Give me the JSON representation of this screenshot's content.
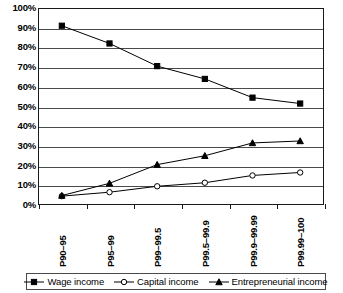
{
  "chart_data": {
    "type": "line",
    "title": "",
    "xlabel": "",
    "ylabel": "",
    "ylim": [
      0,
      100
    ],
    "ytick_labels": [
      "100%",
      "90%",
      "80%",
      "70%",
      "60%",
      "50%",
      "40%",
      "30%",
      "20%",
      "10%",
      "0%"
    ],
    "ytick_values": [
      100,
      90,
      80,
      70,
      60,
      50,
      40,
      30,
      20,
      10,
      0
    ],
    "grid": "horizontal",
    "legend_position": "bottom",
    "categories": [
      "P90–95",
      "P95–99",
      "P99–99.5",
      "P99.5–99.9",
      "P99.9–99.99",
      "P99.99–100"
    ],
    "series": [
      {
        "name": "Wage income",
        "marker": "filled-square",
        "color": "#000000",
        "values": [
          91,
          82,
          70.5,
          64,
          54.5,
          51.5
        ]
      },
      {
        "name": "Capital income",
        "marker": "open-circle",
        "color": "#000000",
        "values": [
          4.5,
          6.5,
          9.5,
          11.3,
          15,
          16.5
        ]
      },
      {
        "name": "Entrepreneurial income",
        "marker": "filled-triangle",
        "color": "#000000",
        "values": [
          4.8,
          11,
          20.5,
          25,
          31.5,
          32.5
        ]
      }
    ]
  }
}
